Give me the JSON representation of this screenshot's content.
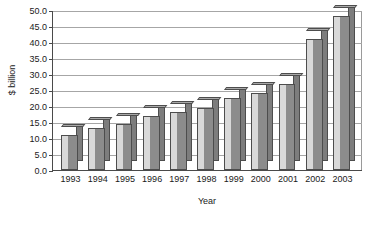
{
  "chart_data": {
    "type": "bar",
    "title": "",
    "xlabel": "Year",
    "ylabel": "$ billion",
    "categories": [
      "1993",
      "1994",
      "1995",
      "1996",
      "1997",
      "1998",
      "1999",
      "2000",
      "2001",
      "2002",
      "2003"
    ],
    "values": [
      11.0,
      13.0,
      14.5,
      17.0,
      18.0,
      19.5,
      22.5,
      24.0,
      27.0,
      41.0,
      48.0
    ],
    "series": [
      {
        "name": "$ billion",
        "values": [
          11.0,
          13.0,
          14.5,
          17.0,
          18.0,
          19.5,
          22.5,
          24.0,
          27.0,
          41.0,
          48.0
        ]
      }
    ],
    "ylim": [
      0.0,
      50.0
    ],
    "ytick_step": 5.0,
    "yticks": [
      "0.0",
      "5.0",
      "10.0",
      "15.0",
      "20.0",
      "25.0",
      "30.0",
      "35.0",
      "40.0",
      "45.0",
      "50.0"
    ],
    "ytick_values": [
      0.0,
      5.0,
      10.0,
      15.0,
      20.0,
      25.0,
      30.0,
      35.0,
      40.0,
      45.0,
      50.0
    ],
    "grid": true,
    "grid_axis": "y",
    "legend": false,
    "legend_position": "none",
    "style": "3d-column",
    "colors": {
      "bar_front": "#8c8c8c",
      "bar_side": "#d9d9d9",
      "bar_top": "#a8a8a8",
      "bar_outline": "#4d4d4d",
      "gridline": "#a6a6a6",
      "axis": "#4a4a4a",
      "text": "#1a1a1a",
      "background": "#ffffff"
    }
  }
}
